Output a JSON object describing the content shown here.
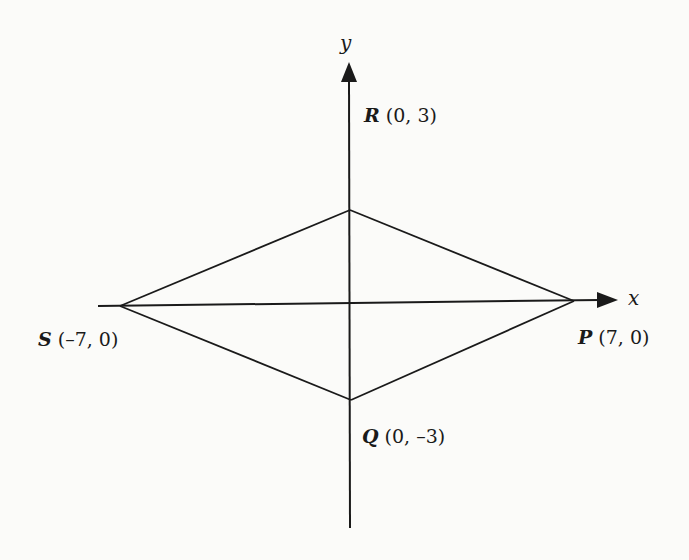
{
  "diagram": {
    "type": "coordinate-geometry",
    "axes": {
      "x_label": "x",
      "y_label": "y"
    },
    "points": {
      "R": {
        "name": "R",
        "coords": "(0, 3)",
        "x": 0,
        "y": 3
      },
      "S": {
        "name": "S",
        "coords": "(–7, 0)",
        "x": -7,
        "y": 0
      },
      "P": {
        "name": "P",
        "coords": "(7, 0)",
        "x": 7,
        "y": 0
      },
      "Q": {
        "name": "Q",
        "coords": "(0, –3)",
        "x": 0,
        "y": -3
      }
    },
    "segments": [
      "SR",
      "RP",
      "PQ",
      "QS",
      "SP"
    ],
    "colors": {
      "stroke": "#1a1a1a",
      "background": "#fbfbf9"
    }
  }
}
